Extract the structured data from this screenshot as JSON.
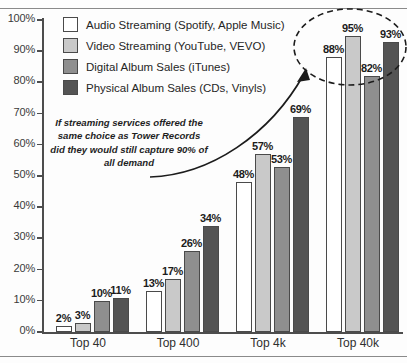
{
  "chart_data": {
    "type": "bar",
    "title": "",
    "subtitle": "",
    "xlabel": "",
    "ylabel": "",
    "ylim": [
      0,
      100
    ],
    "grid": false,
    "legend_position": "top-left",
    "categories": [
      "Top 40",
      "Top 400",
      "Top 4k",
      "Top 40k"
    ],
    "ytick_labels": [
      "0%",
      "10%",
      "20%",
      "30%",
      "40%",
      "50%",
      "60%",
      "70%",
      "80%",
      "90%",
      "100%"
    ],
    "ytick_values": [
      0,
      10,
      20,
      30,
      40,
      50,
      60,
      70,
      80,
      90,
      100
    ],
    "series": [
      {
        "name": "Audio Streaming (Spotify, Apple Music)",
        "color": "#ffffff",
        "values": [
          2,
          13,
          48,
          88
        ],
        "labels": [
          "2%",
          "13%",
          "48%",
          "88%"
        ]
      },
      {
        "name": "Video Streaming (YouTube, VEVO)",
        "color": "#c9c9c9",
        "values": [
          3,
          17,
          57,
          95
        ],
        "labels": [
          "3%",
          "17%",
          "57%",
          "95%"
        ]
      },
      {
        "name": "Digital Album Sales (iTunes)",
        "color": "#8f8f8f",
        "values": [
          10,
          26,
          53,
          82
        ],
        "labels": [
          "10%",
          "26%",
          "53%",
          "82%"
        ]
      },
      {
        "name": "Physical Album Sales (CDs, Vinyls)",
        "color": "#545454",
        "values": [
          11,
          34,
          69,
          93
        ],
        "labels": [
          "11%",
          "34%",
          "69%",
          "93%"
        ]
      }
    ],
    "annotations": [
      {
        "id": "streaming-note",
        "text": "If streaming services offered the same choice as Tower Records did they would still capture 90% of all demand",
        "style": "italic-bold",
        "points_to": "Top 40k"
      },
      {
        "id": "highlight-ellipse",
        "shape": "dashed-ellipse",
        "encircles": "Top 40k"
      }
    ]
  },
  "colors": {
    "axis": "#4d4d4d",
    "bar_outline": "#4a4a4a",
    "text": "#262626",
    "background": "#fdfdfd"
  }
}
